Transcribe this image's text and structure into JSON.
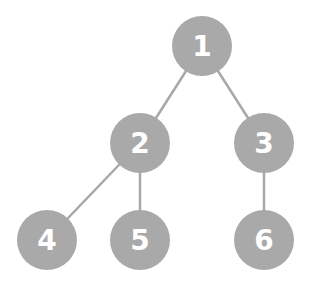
{
  "diagram": {
    "type": "binary-tree",
    "node_color": "#a9a9a9",
    "edge_color": "#a8a8a8",
    "label_color": "#ffffff",
    "nodes": [
      {
        "id": "1",
        "label": "1",
        "x": 202,
        "y": 46
      },
      {
        "id": "2",
        "label": "2",
        "x": 140,
        "y": 143
      },
      {
        "id": "3",
        "label": "3",
        "x": 264,
        "y": 143
      },
      {
        "id": "4",
        "label": "4",
        "x": 47,
        "y": 240
      },
      {
        "id": "5",
        "label": "5",
        "x": 140,
        "y": 240
      },
      {
        "id": "6",
        "label": "6",
        "x": 264,
        "y": 240
      }
    ],
    "edges": [
      {
        "from": "1",
        "to": "2"
      },
      {
        "from": "1",
        "to": "3"
      },
      {
        "from": "2",
        "to": "4"
      },
      {
        "from": "2",
        "to": "5"
      },
      {
        "from": "3",
        "to": "6"
      }
    ]
  }
}
